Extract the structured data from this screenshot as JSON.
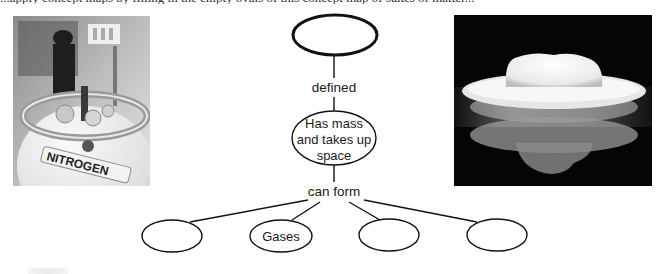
{
  "header": {
    "cutoff_text": "...apply concept maps by filling in the empty ovals of this concept map of states of matter..."
  },
  "photos": {
    "left": {
      "subject": "liquid nitrogen dewar tank",
      "label_on_tank": "NITROGEN"
    },
    "right": {
      "subject": "dry ice / cold vapor dish with reflection"
    }
  },
  "concept_map": {
    "top_node": {
      "text": ""
    },
    "link_1": "defined",
    "middle_node": {
      "lines": [
        "Has mass",
        "and takes up",
        "space"
      ]
    },
    "link_2": "can form",
    "bottom_nodes": [
      {
        "text": ""
      },
      {
        "text": "Gases"
      },
      {
        "text": ""
      },
      {
        "text": ""
      }
    ]
  },
  "colors": {
    "stroke": "#111111",
    "text": "#1a1a1a",
    "background": "#ffffff"
  }
}
